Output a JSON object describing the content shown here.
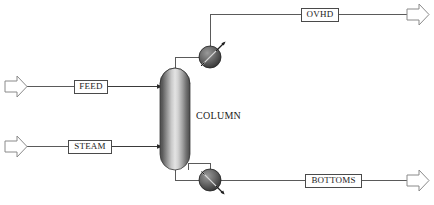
{
  "diagram": {
    "background_color": "#ffffff",
    "line_color": "#5a5a5a",
    "text_color": "#1a1a1a"
  },
  "equipment": [
    {
      "id": "column",
      "label": "COLUMN",
      "type": "vertical-vessel",
      "label_x": 196,
      "label_y": 110
    },
    {
      "id": "condenser",
      "label": "",
      "type": "heat-exchanger",
      "cx": 210,
      "cy": 57,
      "r": 11,
      "arrow_direction": "up-right"
    },
    {
      "id": "reboiler",
      "label": "",
      "type": "heat-exchanger",
      "cx": 210,
      "cy": 180,
      "r": 11,
      "arrow_direction": "down-right"
    }
  ],
  "streams": [
    {
      "id": "feed",
      "label": "FEED",
      "tag_x": 74,
      "tag_y": 80,
      "tag_width": 34,
      "direction": "inlet"
    },
    {
      "id": "steam",
      "label": "STEAM",
      "tag_x": 68,
      "tag_y": 140,
      "tag_width": 44,
      "direction": "inlet"
    },
    {
      "id": "ovhd",
      "label": "OVHD",
      "tag_x": 301,
      "tag_y": 8,
      "tag_width": 38,
      "direction": "outlet"
    },
    {
      "id": "bottoms",
      "label": "BOTTOMS",
      "tag_x": 305,
      "tag_y": 170,
      "tag_width": 57,
      "direction": "outlet"
    }
  ],
  "arrows": [
    {
      "id": "feed-inlet-arrow",
      "x": 5,
      "y": 80,
      "direction": "right"
    },
    {
      "id": "steam-inlet-arrow",
      "x": 5,
      "y": 140,
      "direction": "right"
    },
    {
      "id": "ovhd-outlet-arrow",
      "x": 408,
      "y": 8,
      "direction": "right"
    },
    {
      "id": "bottoms-outlet-arrow",
      "x": 408,
      "y": 170,
      "direction": "right"
    }
  ]
}
